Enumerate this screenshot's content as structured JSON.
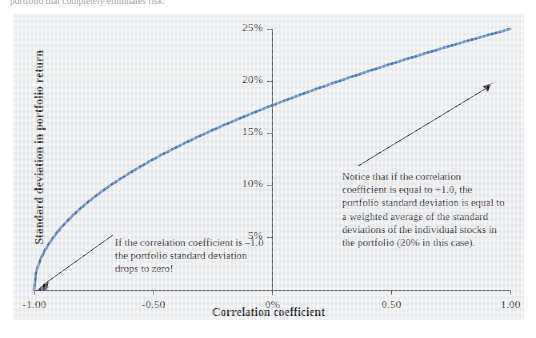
{
  "caption": {
    "text": "portfolio that completely eliminates risk."
  },
  "chart_data": {
    "type": "line",
    "title": "",
    "xlabel": "Correlation coefficient",
    "ylabel": "Standard deviation in portfolio return",
    "xlim": [
      -1.0,
      1.0
    ],
    "ylim": [
      0,
      25
    ],
    "grid": false,
    "legend": "none",
    "line_color": "#3f74b8",
    "xticks": [
      {
        "value": -1.0,
        "label": "-1.00"
      },
      {
        "value": -0.5,
        "label": "-0.50"
      },
      {
        "value": 0.0,
        "label": "0%"
      },
      {
        "value": 0.5,
        "label": "0.50"
      },
      {
        "value": 1.0,
        "label": "1.00"
      }
    ],
    "yticks": [
      {
        "value": 0,
        "label": "0%"
      },
      {
        "value": 5,
        "label": "5%"
      },
      {
        "value": 10,
        "label": "10%"
      },
      {
        "value": 15,
        "label": "15%"
      },
      {
        "value": 20,
        "label": "20%"
      },
      {
        "value": 25,
        "label": "25%"
      }
    ],
    "series": [
      {
        "name": "Portfolio standard deviation",
        "x": [
          -1.0,
          -0.98,
          -0.95,
          -0.9,
          -0.8,
          -0.7,
          -0.6,
          -0.5,
          -0.4,
          -0.3,
          -0.2,
          -0.1,
          0.0,
          0.1,
          0.2,
          0.3,
          0.4,
          0.5,
          0.6,
          0.7,
          0.8,
          0.9,
          1.0
        ],
        "values": [
          0.0,
          2.0,
          3.16,
          4.47,
          6.32,
          7.75,
          8.94,
          10.0,
          10.95,
          11.83,
          12.65,
          13.42,
          14.14,
          14.83,
          15.49,
          16.12,
          16.73,
          17.32,
          17.89,
          18.44,
          18.97,
          19.49,
          20.0
        ]
      }
    ],
    "annotations": [
      {
        "id": "left",
        "text": "If the correlation coefficient is –1.0 the portfolio standard deviation drops to zero!",
        "points_to": {
          "x": -1.0,
          "y": 0
        }
      },
      {
        "id": "right",
        "text": "Notice that if the correlation coefficient is equal to +1.0, the portfolio standard deviation is equal to a weighted average of the standard deviations of the individual stocks in the portfolio (20% in this case).",
        "points_to": {
          "x": 1.0,
          "y": 20
        }
      }
    ]
  }
}
